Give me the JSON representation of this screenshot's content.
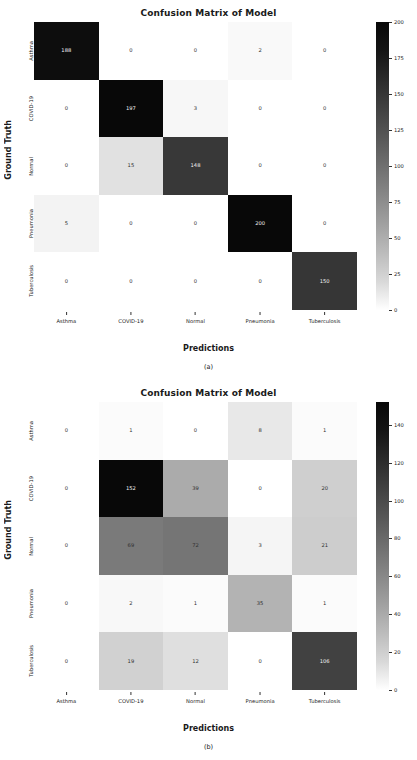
{
  "figures": [
    {
      "id": "a",
      "caption": "(a)",
      "title": "Confusion Matrix of Model",
      "chart_data": {
        "type": "heatmap",
        "title": "Confusion Matrix of Model",
        "xlabel": "Predictions",
        "ylabel": "Ground Truth",
        "categories": [
          "Asthma",
          "COVID-19",
          "Normal",
          "Pneumonia",
          "Tuberculosis"
        ],
        "row_labels": [
          "Asthma",
          "COVID-19",
          "Normal",
          "Pneumonia",
          "Tuberculosis"
        ],
        "col_labels": [
          "Asthma",
          "COVID-19",
          "Normal",
          "Pneumonia",
          "Tuberculosis"
        ],
        "values": [
          [
            188,
            0,
            0,
            2,
            0
          ],
          [
            0,
            197,
            3,
            0,
            0
          ],
          [
            0,
            15,
            148,
            0,
            0
          ],
          [
            5,
            0,
            0,
            200,
            0
          ],
          [
            0,
            0,
            0,
            0,
            150
          ]
        ],
        "colorbar": {
          "min": 0,
          "max": 200,
          "ticks": [
            0,
            25,
            50,
            75,
            100,
            125,
            150,
            175,
            200
          ],
          "colormap": "greys_reversed"
        },
        "grid": false,
        "legend": "none"
      }
    },
    {
      "id": "b",
      "caption": "(b)",
      "title": "Confusion Matrix of Model",
      "chart_data": {
        "type": "heatmap",
        "title": "Confusion Matrix of Model",
        "xlabel": "Predictions",
        "ylabel": "Ground Truth",
        "categories": [
          "Asthma",
          "COVID-19",
          "Normal",
          "Pneumonia",
          "Tuberculosis"
        ],
        "row_labels": [
          "Asthma",
          "COVID-19",
          "Normal",
          "Pneumonia",
          "Tuberculosis"
        ],
        "col_labels": [
          "Asthma",
          "COVID-19",
          "Normal",
          "Pneumonia",
          "Tuberculosis"
        ],
        "values": [
          [
            0,
            1,
            0,
            8,
            1
          ],
          [
            0,
            152,
            39,
            0,
            20
          ],
          [
            0,
            69,
            72,
            3,
            21
          ],
          [
            0,
            2,
            1,
            35,
            1
          ],
          [
            0,
            19,
            12,
            0,
            106
          ]
        ],
        "colorbar": {
          "min": 0,
          "max": 152,
          "ticks": [
            0,
            20,
            40,
            60,
            80,
            100,
            120,
            140
          ],
          "colormap": "greys_reversed"
        },
        "grid": false,
        "legend": "none"
      }
    }
  ],
  "style": {
    "text_dark": "#1a1a1a",
    "cell_text_light": "#f2f2f2",
    "cell_text_dark": "#303030"
  }
}
